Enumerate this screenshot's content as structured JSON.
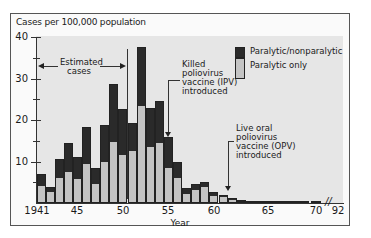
{
  "chart_data": {
    "type": "bar",
    "stacked": true,
    "title": "",
    "ylabel": "Cases per 100,000 population",
    "xlabel": "Year",
    "ylim": [
      0,
      40
    ],
    "yticks": [
      10,
      20,
      30,
      40
    ],
    "xtick_labels": [
      "1941",
      "45",
      "50",
      "55",
      "60",
      "65",
      "70",
      "92"
    ],
    "categories": [
      "1941",
      "1942",
      "1943",
      "1944",
      "1945",
      "1946",
      "1947",
      "1948",
      "1949",
      "1950",
      "1951",
      "1952",
      "1953",
      "1954",
      "1955",
      "1956",
      "1957",
      "1958",
      "1959",
      "1960",
      "1961",
      "1962",
      "1963",
      "1964",
      "1965",
      "1966",
      "1967",
      "1968",
      "1969",
      "1970"
    ],
    "series": [
      {
        "name": "Paralytic only",
        "color": "#c4c4c4",
        "values": [
          3.9,
          2.4,
          5.8,
          7.2,
          5.5,
          9.2,
          4.3,
          9.6,
          14.5,
          11.3,
          12.3,
          23.1,
          13.3,
          14.2,
          8.2,
          5.8,
          1.9,
          2.9,
          3.6,
          1.4,
          1.2,
          0.6,
          0.3,
          0.1,
          0.1,
          0.1,
          0.0,
          0.0,
          0.0,
          0.0
        ]
      },
      {
        "name": "Paralytic/nonparalytic",
        "color": "#2a2a2a",
        "values": [
          3.1,
          1.5,
          4.8,
          7.2,
          5.7,
          9.0,
          4.2,
          9.1,
          14.2,
          11.3,
          7.0,
          14.5,
          9.6,
          10.4,
          7.7,
          4.1,
          1.7,
          1.7,
          1.5,
          1.2,
          0.7,
          0.6,
          0.4,
          0.2,
          0.2,
          0.2,
          0.2,
          0.2,
          0.2,
          0.2
        ]
      }
    ],
    "totals": [
      7.0,
      3.9,
      10.6,
      14.4,
      11.2,
      18.2,
      8.5,
      18.7,
      28.7,
      22.6,
      19.3,
      37.6,
      22.9,
      24.6,
      15.9,
      9.9,
      3.6,
      4.6,
      5.1,
      2.6,
      1.9,
      1.2,
      0.7,
      0.3,
      0.3,
      0.3,
      0.2,
      0.2,
      0.2,
      0.2
    ],
    "legend": {
      "position": "upper right",
      "entries": [
        "Paralytic/nonparalytic",
        "Paralytic only"
      ]
    },
    "annotations": [
      {
        "text": "Estimated cases",
        "span": [
          "1941",
          "1951"
        ]
      },
      {
        "text": "Killed poliovirus vaccine (IPV) introduced",
        "x": "1955"
      },
      {
        "text": "Live oral poliovirus vaccine (OPV) introduced",
        "x": "1961"
      }
    ],
    "axis_break": "70 // 92",
    "grid": false
  },
  "labels": {
    "ylabel": "Cases per 100,000 population",
    "xlabel": "Year",
    "yticks": [
      "40",
      "30",
      "20",
      "10"
    ],
    "xticks": [
      "1941",
      "45",
      "50",
      "55",
      "60",
      "65",
      "70",
      "92"
    ],
    "legend_dark": "Paralytic/nonparalytic",
    "legend_light": "Paralytic only",
    "estimated_1": "Estimated",
    "estimated_2": "cases",
    "ipv": [
      "Killed",
      "poliovirus",
      "vaccine (IPV)",
      "introduced"
    ],
    "opv": [
      "Live oral",
      "poliovirus",
      "vaccine (OPV)",
      "introduced"
    ],
    "break_mark": "//"
  }
}
